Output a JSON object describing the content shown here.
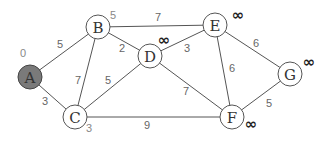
{
  "graph": {
    "nodes": [
      {
        "id": "A",
        "x": 30,
        "y": 77,
        "dist": "0",
        "dx": -7,
        "dy": -24,
        "start": true
      },
      {
        "id": "B",
        "x": 98,
        "y": 27,
        "dist": "5",
        "dx": 15,
        "dy": -12
      },
      {
        "id": "C",
        "x": 75,
        "y": 117,
        "dist": "3",
        "dx": 14,
        "dy": 11
      },
      {
        "id": "D",
        "x": 150,
        "y": 56,
        "dist": "∞",
        "dx": 14,
        "dy": -16
      },
      {
        "id": "E",
        "x": 215,
        "y": 25,
        "dist": "∞",
        "dx": 23,
        "dy": -10
      },
      {
        "id": "F",
        "x": 232,
        "y": 117,
        "dist": "∞",
        "dx": 19,
        "dy": 7
      },
      {
        "id": "G",
        "x": 290,
        "y": 74,
        "dist": "∞",
        "dx": 19,
        "dy": -12
      }
    ],
    "edges": [
      {
        "from": "A",
        "to": "B",
        "weight": "5",
        "lx": 60,
        "ly": 44
      },
      {
        "from": "A",
        "to": "C",
        "weight": "3",
        "lx": 45,
        "ly": 101
      },
      {
        "from": "B",
        "to": "C",
        "weight": "7",
        "lx": 78,
        "ly": 80
      },
      {
        "from": "B",
        "to": "D",
        "weight": "2",
        "lx": 122,
        "ly": 48
      },
      {
        "from": "B",
        "to": "E",
        "weight": "7",
        "lx": 158,
        "ly": 17
      },
      {
        "from": "C",
        "to": "D",
        "weight": "5",
        "lx": 108,
        "ly": 80
      },
      {
        "from": "C",
        "to": "F",
        "weight": "9",
        "lx": 147,
        "ly": 125
      },
      {
        "from": "D",
        "to": "E",
        "weight": "3",
        "lx": 187,
        "ly": 48
      },
      {
        "from": "D",
        "to": "F",
        "weight": "7",
        "lx": 186,
        "ly": 91
      },
      {
        "from": "E",
        "to": "F",
        "weight": "6",
        "lx": 232,
        "ly": 68
      },
      {
        "from": "E",
        "to": "G",
        "weight": "6",
        "lx": 256,
        "ly": 43
      },
      {
        "from": "F",
        "to": "G",
        "weight": "5",
        "lx": 269,
        "ly": 103
      }
    ]
  }
}
